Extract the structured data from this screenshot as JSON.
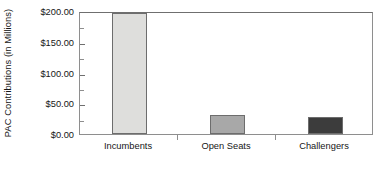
{
  "chart_data": {
    "type": "bar",
    "title": "",
    "xlabel": "",
    "ylabel": "PAC Contributions (in Millions)",
    "categories": [
      "Incumbents",
      "Open Seats",
      "Challengers"
    ],
    "values": [
      196,
      31,
      27
    ],
    "value_unit": "millions of dollars",
    "ylim": [
      0,
      200
    ],
    "ytick_values": [
      0,
      50,
      100,
      150,
      200
    ],
    "ytick_labels": [
      "$0.00",
      "$50.00",
      "$100.00",
      "$150.00",
      "$200.00"
    ],
    "yminor_tick_values": [
      25,
      75,
      125,
      175
    ],
    "grid": false,
    "legend": false,
    "bar_colors": [
      "#dededc",
      "#a8a8a8",
      "#3c3c3c"
    ],
    "bar_edge_color": "#6d6d6d",
    "frame_color": "#8e8e8e",
    "background_color": "#ffffff",
    "series": [
      {
        "name": "PAC Contributions",
        "points": [
          {
            "category": "Incumbents",
            "value": 196,
            "color": "#dededc"
          },
          {
            "category": "Open Seats",
            "value": 31,
            "color": "#a8a8a8"
          },
          {
            "category": "Challengers",
            "value": 27,
            "color": "#3c3c3c"
          }
        ]
      }
    ]
  }
}
